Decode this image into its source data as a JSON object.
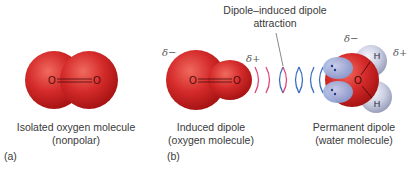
{
  "figure": {
    "panel_a": {
      "letter": "(a)",
      "caption_line1": "Isolated oxygen molecule",
      "caption_line2": "(nonpolar)",
      "atoms": [
        "O",
        "O"
      ]
    },
    "panel_b": {
      "letter": "(b)",
      "induced": {
        "caption_line1": "Induced dipole",
        "caption_line2": "(oxygen molecule)",
        "delta_minus": "δ−",
        "delta_plus": "δ+",
        "atoms": [
          "O",
          "O"
        ]
      },
      "interaction_label_line1": "Dipole–induced dipole",
      "interaction_label_line2": "attraction",
      "permanent": {
        "caption_line1": "Permanent dipole",
        "caption_line2": "(water molecule)",
        "delta_minus": "δ−",
        "delta_plus": "δ+",
        "atoms": [
          "O",
          "H",
          "H"
        ]
      }
    },
    "colors": {
      "oxygen_red": "#d42a2a",
      "hydrogen_gray": "#c9cde0",
      "lone_pair_blue": "#8fa3d6",
      "arc_pink": "#e0457a",
      "arc_blue": "#3b6fc2"
    }
  }
}
